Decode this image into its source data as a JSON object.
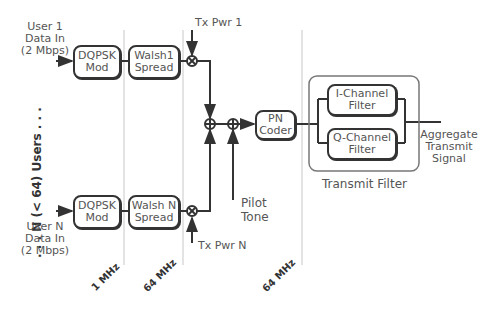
{
  "diagram": {
    "users_label": ". . . N (< 64) Users . . .",
    "user1": {
      "input_label": [
        "User 1",
        "Data In",
        "(2 Mbps)"
      ],
      "modulator": [
        "DQPSK",
        "Mod"
      ],
      "spreader": [
        "Walsh1",
        "Spread"
      ],
      "power_label": "Tx Pwr 1"
    },
    "userN": {
      "input_label": [
        "User N",
        "Data In",
        "(2 Mbps)"
      ],
      "modulator": [
        "DQPSK",
        "Mod"
      ],
      "spreader": [
        "Walsh N",
        "Spread"
      ],
      "power_label": "Tx Pwr N"
    },
    "multiplier_symbol": "⊗",
    "adder_symbol": "⊕",
    "pilot_label": [
      "Pilot",
      "Tone"
    ],
    "pn_coder": [
      "PN",
      "Coder"
    ],
    "transmit_filter": {
      "title": "Transmit Filter",
      "i_channel": [
        "I-Channel",
        "Filter"
      ],
      "q_channel": [
        "Q-Channel",
        "Filter"
      ]
    },
    "output_label": [
      "Aggregate",
      "Transmit",
      "Signal"
    ],
    "clock_rates": [
      "1 MHz",
      "64 MHz",
      "64 MHz"
    ]
  }
}
